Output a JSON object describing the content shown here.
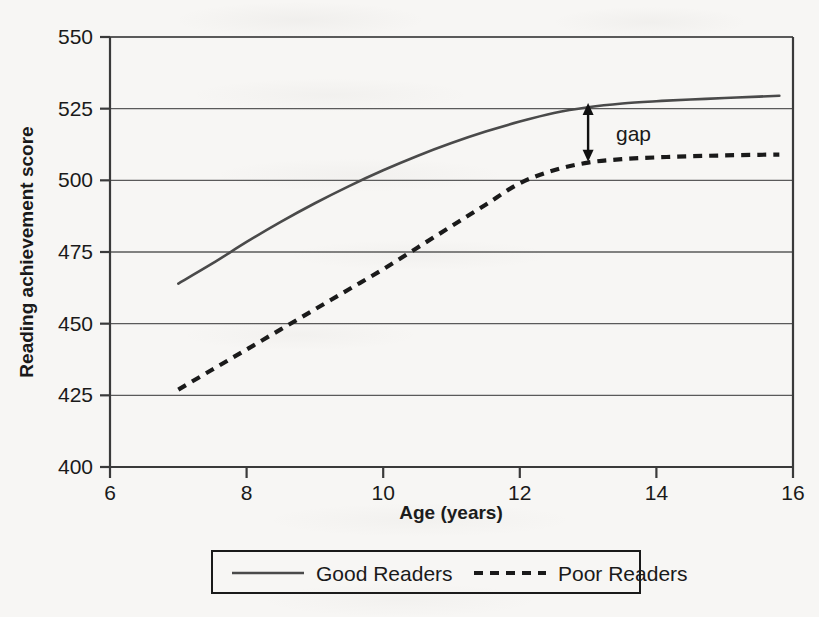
{
  "chart_data": {
    "type": "line",
    "title": "",
    "xlabel": "Age (years)",
    "ylabel": "Reading achievement score",
    "xlim": [
      6,
      16
    ],
    "ylim": [
      400,
      550
    ],
    "xticks": [
      "6",
      "8",
      "10",
      "12",
      "14",
      "16"
    ],
    "xtick_values": [
      6,
      8,
      10,
      12,
      14,
      16
    ],
    "yticks": [
      "400",
      "425",
      "450",
      "475",
      "500",
      "525",
      "550"
    ],
    "ytick_values": [
      400,
      425,
      450,
      475,
      500,
      525,
      550
    ],
    "grid": "horizontal",
    "legend_position": "below-plot",
    "series": [
      {
        "name": "Good Readers",
        "style": "solid",
        "color": "#4a4a4a",
        "x": [
          7,
          7.5,
          8,
          8.5,
          9,
          9.5,
          10,
          10.5,
          11,
          11.5,
          12,
          12.5,
          13,
          13.5,
          14,
          14.5,
          15,
          15.5,
          15.8
        ],
        "y": [
          464,
          471,
          478.5,
          485.5,
          492,
          498,
          503.5,
          508.5,
          513,
          517,
          520.5,
          523.5,
          525.5,
          526.8,
          527.6,
          528.2,
          528.7,
          529.2,
          529.5
        ]
      },
      {
        "name": "Poor Readers",
        "style": "dashed",
        "color": "#1a1a1a",
        "x": [
          7,
          7.5,
          8,
          8.5,
          9,
          9.5,
          10,
          10.5,
          11,
          11.5,
          12,
          12.5,
          13,
          13.5,
          14,
          14.5,
          15,
          15.5,
          15.8
        ],
        "y": [
          427,
          434,
          441,
          448,
          455,
          462,
          469,
          476.5,
          484,
          491.5,
          499,
          503.5,
          506.2,
          507.4,
          508,
          508.4,
          508.7,
          508.9,
          509
        ]
      }
    ],
    "annotations": [
      {
        "label": "gap",
        "type": "double-headed-vertical-arrow",
        "x": 13,
        "y_top": 527,
        "y_bottom": 506.5,
        "label_x": 13.35,
        "label_y": 516
      }
    ]
  },
  "legend": {
    "entries": [
      {
        "label": "Good Readers",
        "style": "solid"
      },
      {
        "label": "Poor Readers",
        "style": "dashed"
      }
    ]
  }
}
